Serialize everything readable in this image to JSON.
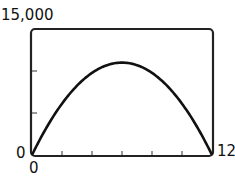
{
  "chart_data": {
    "type": "line",
    "title": "",
    "xlabel": "",
    "ylabel": "",
    "xlim": [
      0,
      12
    ],
    "ylim": [
      0,
      15000
    ],
    "x_tick_count": 6,
    "y_tick_count": 3,
    "grid": false,
    "legend": "none",
    "series": [
      {
        "name": "curve",
        "x": [
          0,
          1,
          2,
          3,
          4,
          5,
          6,
          7,
          8,
          9,
          10,
          11,
          12
        ],
        "y": [
          0,
          3360,
          6110,
          8250,
          9780,
          10690,
          11000,
          10690,
          9780,
          8250,
          6110,
          3360,
          0
        ]
      }
    ]
  },
  "labels": {
    "y_max": "15,000",
    "y_min": "0",
    "x_min": "0",
    "x_max": "12"
  }
}
